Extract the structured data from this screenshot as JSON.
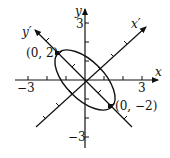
{
  "diagram": {
    "type": "rotated-ellipse-axes",
    "colors": {
      "ink": "#111111",
      "background": "#ffffff"
    },
    "axes": {
      "x_label": "x",
      "y_label": "y",
      "x_prime_label": "x′",
      "y_prime_label": "y′",
      "x_ticks": {
        "neg": "−3",
        "pos": "3"
      },
      "y_ticks": {
        "pos": "3",
        "neg": "−3"
      }
    },
    "points": [
      {
        "label": "(0, 2)",
        "frame": "x′y′"
      },
      {
        "label": "(0, −2)",
        "frame": "x′y′"
      }
    ],
    "ellipse": {
      "center": [
        0,
        0
      ],
      "rotation_deg": 45,
      "major_axis": "y′",
      "semi_major": 2,
      "semi_minor": 1
    }
  }
}
